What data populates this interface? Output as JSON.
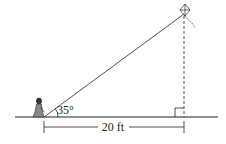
{
  "diagram": {
    "angle_label": "35°",
    "distance_label": "20 ft",
    "elements": [
      "person",
      "kite",
      "kite-string",
      "ground",
      "vertical-height-dashed",
      "right-angle-marker",
      "horizontal-distance-dimension"
    ],
    "colors": {
      "stroke": "#222222",
      "background": "#ffffff"
    }
  }
}
